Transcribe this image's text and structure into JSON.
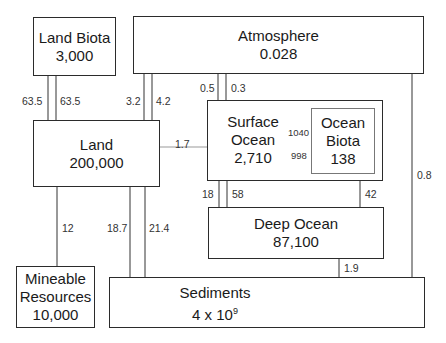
{
  "diagram": {
    "reservoirs": {
      "land_biota": {
        "name": "Land Biota",
        "value": "3,000"
      },
      "atmosphere": {
        "name": "Atmosphere",
        "value": "0.028"
      },
      "land": {
        "name": "Land",
        "value": "200,000"
      },
      "surface_ocean": {
        "name_line1": "Surface",
        "name_line2": "Ocean",
        "value": "2,710"
      },
      "ocean_biota": {
        "name_line1": "Ocean",
        "name_line2": "Biota",
        "value": "138"
      },
      "deep_ocean": {
        "name": "Deep Ocean",
        "value": "87,100"
      },
      "mineable": {
        "name_line1": "Mineable",
        "name_line2": "Resources",
        "value": "10,000"
      },
      "sediments": {
        "name": "Sediments",
        "value_base": "4 x 10",
        "value_exp": "9"
      }
    },
    "fluxes": {
      "land_to_land_biota": "63.5",
      "land_biota_to_land": "63.5",
      "atmosphere_to_land": "3.2",
      "land_to_atmosphere": "4.2",
      "atmosphere_to_surface_ocean": "0.5",
      "surface_ocean_to_atmosphere": "0.3",
      "land_to_surface_ocean": "1.7",
      "surface_ocean_to_ocean_biota": "1040",
      "ocean_biota_to_surface_ocean": "998",
      "deep_ocean_to_surface_ocean": "18",
      "surface_ocean_to_deep_ocean": "58",
      "ocean_biota_to_deep_ocean": "42",
      "atmosphere_to_sediments": "0.8",
      "mineable_to_land": "12",
      "land_to_sediments": "18.7",
      "sediments_to_land": "21.4",
      "deep_ocean_to_sediments": "1.9"
    }
  }
}
